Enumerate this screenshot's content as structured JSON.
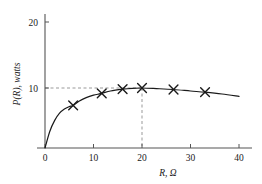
{
  "chart_data": {
    "type": "line",
    "title": "",
    "subtitle": "",
    "xlabel": "R, Ω",
    "ylabel": "P(R), watts",
    "xlim": [
      0,
      40
    ],
    "ylim": [
      0,
      23
    ],
    "xticks": [
      0,
      10,
      20,
      30,
      40
    ],
    "yticks": [
      10,
      20
    ],
    "xtick_labels": [
      "0",
      "10",
      "20",
      "30",
      "40"
    ],
    "ytick_labels": [
      "10",
      "20"
    ],
    "grid": false,
    "legend": null,
    "marker": "x",
    "series": [
      {
        "name": "P(R)",
        "x": [
          0,
          1,
          2,
          3,
          4,
          5,
          5.8,
          7,
          8.5,
          10,
          11.7,
          13.5,
          16,
          18,
          20,
          23,
          26.5,
          30,
          33,
          36.5,
          40
        ],
        "values": [
          0,
          2.8,
          4.6,
          5.8,
          6.5,
          6.9,
          7.1,
          7.8,
          8.4,
          8.8,
          9.1,
          9.5,
          9.8,
          9.95,
          10.0,
          9.9,
          9.75,
          9.5,
          9.3,
          9.0,
          8.6
        ]
      }
    ],
    "markers": [
      {
        "x": 5.8,
        "y": 7.1
      },
      {
        "x": 11.7,
        "y": 9.1
      },
      {
        "x": 16.0,
        "y": 9.8
      },
      {
        "x": 20.0,
        "y": 10.0
      },
      {
        "x": 26.5,
        "y": 9.75
      },
      {
        "x": 33.0,
        "y": 9.3
      }
    ],
    "annotations": [
      {
        "name": "peak-horizontal-guide",
        "type": "dashed-hline",
        "y": 10,
        "x_from": 0,
        "x_to": 20,
        "color": "#999999"
      },
      {
        "name": "peak-vertical-guide",
        "type": "dashed-vline",
        "x": 20,
        "y_from": 0,
        "y_to": 10,
        "color": "#999999"
      }
    ],
    "colors": {
      "curve": "#1a1a1a",
      "axis": "#555555",
      "marker": "#1a1a1a",
      "guide": "#999999",
      "background": "#ffffff"
    }
  }
}
